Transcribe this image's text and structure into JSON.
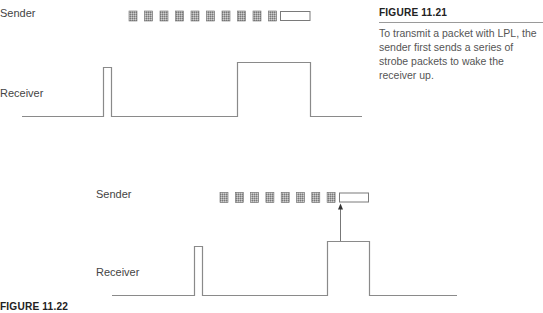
{
  "figure_1121": {
    "title": "FIGURE 11.21",
    "caption": "To transmit a packet with LPL, the sender first sends a series of strobe packets to wake the receiver up.",
    "sender_label": "Sender",
    "receiver_label": "Receiver",
    "strobe_count": 10
  },
  "figure_1122": {
    "title": "FIGURE 11.22",
    "sender_label": "Sender",
    "receiver_label": "Receiver",
    "strobe_count": 8
  },
  "colors": {
    "line": "#8a8a8a",
    "strobe_fill": "#9a9a9a",
    "strobe_border": "#6f6f6f",
    "text": "#444444"
  }
}
